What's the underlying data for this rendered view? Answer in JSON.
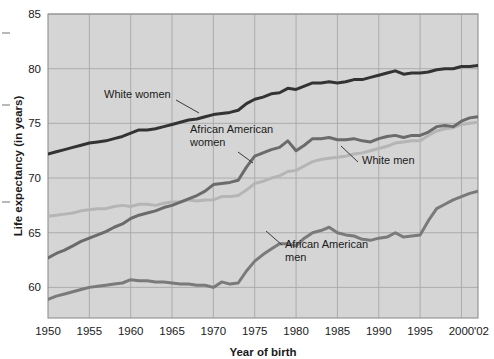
{
  "chart_data": {
    "type": "line",
    "title": "",
    "xlabel": "Year of birth",
    "ylabel": "Life expectancy (in years)",
    "xlim": [
      1950,
      2002
    ],
    "ylim": [
      57.2,
      85
    ],
    "grid": true,
    "legend_position": "inline-annotations",
    "xticks": [
      "1950",
      "1955",
      "1960",
      "1965",
      "1970",
      "1975",
      "1980",
      "1985",
      "1990",
      "1995",
      "2000",
      "'02"
    ],
    "xtick_values": [
      1950,
      1955,
      1960,
      1965,
      1970,
      1975,
      1980,
      1985,
      1990,
      1995,
      2000,
      2002
    ],
    "yticks": [
      "60",
      "65",
      "70",
      "75",
      "80",
      "85"
    ],
    "ytick_values": [
      60,
      65,
      70,
      75,
      80,
      85
    ],
    "x": [
      1950,
      1951,
      1952,
      1953,
      1954,
      1955,
      1956,
      1957,
      1958,
      1959,
      1960,
      1961,
      1962,
      1963,
      1964,
      1965,
      1966,
      1967,
      1968,
      1969,
      1970,
      1971,
      1972,
      1973,
      1974,
      1975,
      1976,
      1977,
      1978,
      1979,
      1980,
      1981,
      1982,
      1983,
      1984,
      1985,
      1986,
      1987,
      1988,
      1989,
      1990,
      1991,
      1992,
      1993,
      1994,
      1995,
      1996,
      1997,
      1998,
      1999,
      2000,
      2001,
      2002
    ],
    "series": [
      {
        "name": "White women",
        "color": "#333333",
        "width": 3.0,
        "values": [
          72.2,
          72.4,
          72.6,
          72.8,
          73.0,
          73.2,
          73.3,
          73.4,
          73.6,
          73.8,
          74.1,
          74.4,
          74.4,
          74.5,
          74.7,
          74.9,
          75.1,
          75.3,
          75.4,
          75.6,
          75.8,
          75.9,
          76.0,
          76.2,
          76.8,
          77.2,
          77.4,
          77.7,
          77.8,
          78.2,
          78.1,
          78.4,
          78.7,
          78.7,
          78.8,
          78.7,
          78.8,
          79.0,
          79.0,
          79.2,
          79.4,
          79.6,
          79.8,
          79.5,
          79.6,
          79.6,
          79.7,
          79.9,
          80.0,
          80.0,
          80.2,
          80.2,
          80.3
        ]
      },
      {
        "name": "African American women",
        "color": "#6b6b6b",
        "width": 3.0,
        "values": [
          62.7,
          63.1,
          63.4,
          63.8,
          64.2,
          64.5,
          64.8,
          65.1,
          65.5,
          65.8,
          66.3,
          66.6,
          66.8,
          67.0,
          67.3,
          67.5,
          67.8,
          68.1,
          68.4,
          68.8,
          69.4,
          69.5,
          69.6,
          69.8,
          71.0,
          72.0,
          72.3,
          72.6,
          72.8,
          73.4,
          72.5,
          73.0,
          73.6,
          73.6,
          73.7,
          73.5,
          73.5,
          73.6,
          73.4,
          73.3,
          73.6,
          73.8,
          73.9,
          73.7,
          73.9,
          73.9,
          74.2,
          74.7,
          74.8,
          74.7,
          75.2,
          75.5,
          75.6
        ]
      },
      {
        "name": "White men",
        "color": "#b5b5b5",
        "width": 3.0,
        "values": [
          66.5,
          66.6,
          66.7,
          66.8,
          67.0,
          67.1,
          67.2,
          67.2,
          67.4,
          67.5,
          67.4,
          67.6,
          67.6,
          67.5,
          67.7,
          67.8,
          67.8,
          68.0,
          67.9,
          68.0,
          68.0,
          68.3,
          68.3,
          68.4,
          68.9,
          69.5,
          69.7,
          70.0,
          70.2,
          70.6,
          70.7,
          71.1,
          71.5,
          71.7,
          71.8,
          71.9,
          72.0,
          72.2,
          72.3,
          72.5,
          72.7,
          72.9,
          73.2,
          73.3,
          73.4,
          73.4,
          73.9,
          74.3,
          74.5,
          74.6,
          74.9,
          75.0,
          75.1
        ]
      },
      {
        "name": "African American men",
        "color": "#7a7a7a",
        "width": 3.0,
        "values": [
          58.9,
          59.2,
          59.4,
          59.6,
          59.8,
          60.0,
          60.1,
          60.2,
          60.3,
          60.4,
          60.7,
          60.6,
          60.6,
          60.5,
          60.5,
          60.4,
          60.3,
          60.3,
          60.2,
          60.2,
          60.0,
          60.5,
          60.3,
          60.4,
          61.5,
          62.4,
          63.0,
          63.5,
          64.0,
          64.0,
          63.8,
          64.5,
          65.0,
          65.2,
          65.5,
          65.0,
          64.8,
          64.7,
          64.4,
          64.3,
          64.5,
          64.6,
          65.0,
          64.6,
          64.7,
          64.8,
          66.1,
          67.2,
          67.6,
          68.0,
          68.3,
          68.6,
          68.8
        ]
      }
    ],
    "annotations": [
      {
        "name": "white-women",
        "lines": [
          "White women"
        ],
        "x": 104,
        "y": 98,
        "leader": [
          [
            176,
            100
          ],
          [
            199,
            113
          ]
        ]
      },
      {
        "name": "african-american-women",
        "lines": [
          "African American",
          "women"
        ],
        "x": 190,
        "y": 133,
        "leader": [
          [
            238,
            152
          ],
          [
            253,
            163
          ]
        ]
      },
      {
        "name": "white-men",
        "lines": [
          "White men"
        ],
        "x": 362,
        "y": 164,
        "leader": [
          [
            358,
            162
          ],
          [
            341,
            146
          ]
        ]
      },
      {
        "name": "african-american-men",
        "lines": [
          "African American",
          "men"
        ],
        "x": 285,
        "y": 248,
        "leader": [
          [
            282,
            245
          ],
          [
            266,
            231
          ]
        ]
      }
    ]
  }
}
